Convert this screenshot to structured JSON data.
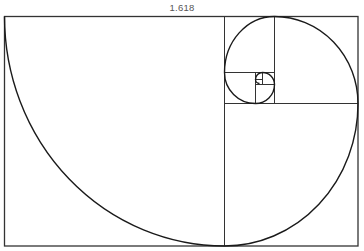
{
  "figure": {
    "title_label": "1.618",
    "line_color": "#222222",
    "divider_color": "#333333",
    "label_color": "#555555"
  }
}
